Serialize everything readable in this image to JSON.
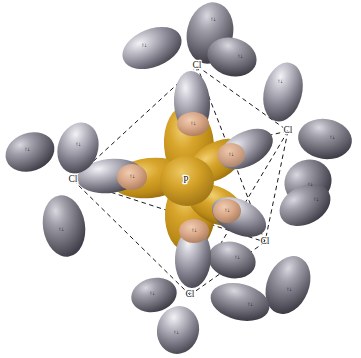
{
  "figure": {
    "background_color": "#ffffff",
    "width": 361,
    "height": 358
  },
  "colors": {
    "phosphorus_orbital": "#c8961e",
    "phosphorus_orbital_dark": "#8f6710",
    "phosphorus_orbital_light": "#e8c35c",
    "chlorine_orbital": "#9b9aa6",
    "chlorine_orbital_dark": "#4f4d58",
    "chlorine_orbital_light": "#e2e2e8",
    "overlap_region": "#d9a888",
    "bond_line": "#1a1a1a",
    "label_text": "#1a1a1a"
  },
  "central_atom": {
    "symbol": "P",
    "name": "phosphorus",
    "x": 186,
    "y": 181
  },
  "ligand_atoms": [
    {
      "symbol": "Cl",
      "name": "chlorine-top",
      "x": 197,
      "y": 66,
      "position": "axial-top"
    },
    {
      "symbol": "Cl",
      "name": "chlorine-right",
      "x": 288,
      "y": 131,
      "position": "equatorial-right"
    },
    {
      "symbol": "Cl",
      "name": "chlorine-lower-right",
      "x": 265,
      "y": 242,
      "position": "equatorial-lower-right"
    },
    {
      "symbol": "Cl",
      "name": "chlorine-bottom",
      "x": 190,
      "y": 295,
      "position": "axial-bottom"
    },
    {
      "symbol": "Cl",
      "name": "chlorine-left",
      "x": 73,
      "y": 180,
      "position": "equatorial-left"
    }
  ],
  "spin_pair_symbol": "↑↓",
  "lone_pair_labels": [
    {
      "atom": "chlorine-top",
      "x": 213,
      "y": 20
    },
    {
      "atom": "chlorine-top",
      "x": 144,
      "y": 46
    },
    {
      "atom": "chlorine-top",
      "x": 240,
      "y": 57
    },
    {
      "atom": "chlorine-right",
      "x": 280,
      "y": 82
    },
    {
      "atom": "chlorine-right",
      "x": 332,
      "y": 138
    },
    {
      "atom": "chlorine-right",
      "x": 310,
      "y": 185
    },
    {
      "atom": "chlorine-lower-right",
      "x": 316,
      "y": 200
    },
    {
      "atom": "chlorine-lower-right",
      "x": 237,
      "y": 258
    },
    {
      "atom": "chlorine-lower-right",
      "x": 289,
      "y": 290
    },
    {
      "atom": "chlorine-bottom",
      "x": 152,
      "y": 294
    },
    {
      "atom": "chlorine-bottom",
      "x": 176,
      "y": 333
    },
    {
      "atom": "chlorine-bottom",
      "x": 250,
      "y": 305
    },
    {
      "atom": "chlorine-left",
      "x": 27,
      "y": 150
    },
    {
      "atom": "chlorine-left",
      "x": 78,
      "y": 145
    },
    {
      "atom": "chlorine-left",
      "x": 61,
      "y": 230
    }
  ],
  "bonding_pair_labels": [
    {
      "bond": "P-Cl-top",
      "x": 193,
      "y": 124
    },
    {
      "bond": "P-Cl-right",
      "x": 231,
      "y": 155
    },
    {
      "bond": "P-Cl-lower-right",
      "x": 227,
      "y": 211
    },
    {
      "bond": "P-Cl-bottom",
      "x": 194,
      "y": 231
    },
    {
      "bond": "P-Cl-left",
      "x": 132,
      "y": 177
    }
  ],
  "skeleton_edges": [
    {
      "from": "chlorine-top",
      "to": "chlorine-left"
    },
    {
      "from": "chlorine-top",
      "to": "chlorine-right"
    },
    {
      "from": "chlorine-top",
      "to": "chlorine-lower-right"
    },
    {
      "from": "chlorine-top",
      "to": "chlorine-bottom"
    },
    {
      "from": "chlorine-left",
      "to": "chlorine-right"
    },
    {
      "from": "chlorine-left",
      "to": "chlorine-lower-right"
    },
    {
      "from": "chlorine-left",
      "to": "chlorine-bottom"
    },
    {
      "from": "chlorine-right",
      "to": "chlorine-lower-right"
    },
    {
      "from": "chlorine-right",
      "to": "chlorine-bottom"
    },
    {
      "from": "chlorine-lower-right",
      "to": "chlorine-bottom"
    }
  ]
}
